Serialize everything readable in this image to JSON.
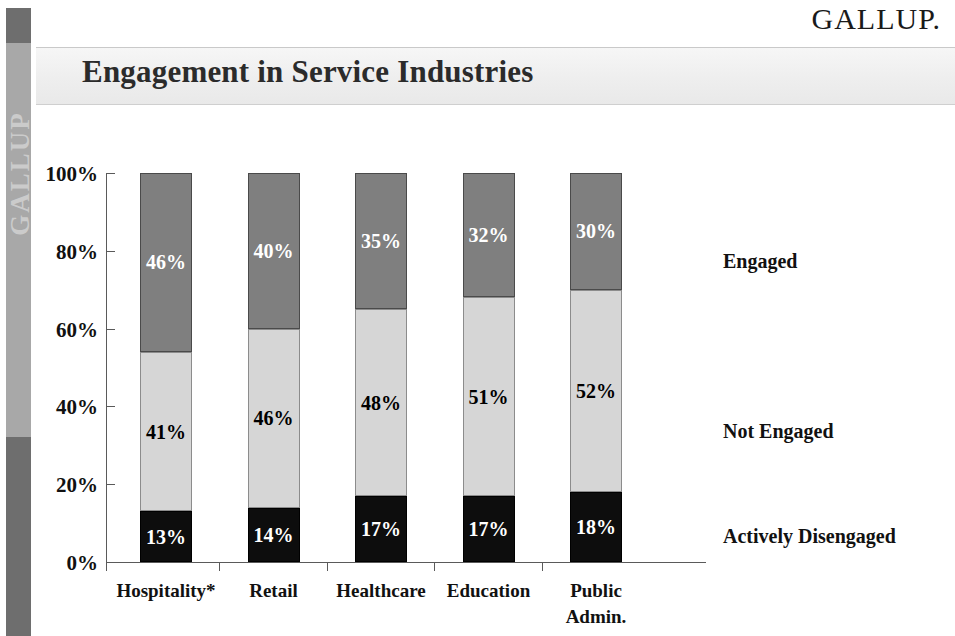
{
  "brand": {
    "logo_text": "GALLUP.",
    "watermark_text": "GALLUP"
  },
  "header": {
    "title": "Engagement in Service Industries"
  },
  "chart_data": {
    "type": "bar",
    "subtype": "stacked-100-percent",
    "title": "Engagement in Service Industries",
    "xlabel": "",
    "ylabel": "",
    "ylim": [
      0,
      100
    ],
    "ytick_labels": [
      "100%",
      "80%",
      "60%",
      "40%",
      "20%",
      "0%"
    ],
    "ytick_values": [
      100,
      80,
      60,
      40,
      20,
      0
    ],
    "grid": false,
    "legend_position": "right",
    "categories": [
      "Hospitality*",
      "Retail",
      "Healthcare",
      "Education",
      "Public Admin."
    ],
    "category_lines": [
      [
        "Hospitality*"
      ],
      [
        "Retail"
      ],
      [
        "Healthcare"
      ],
      [
        "Education"
      ],
      [
        "Public",
        "Admin."
      ]
    ],
    "series": [
      {
        "name": "Engaged",
        "color": "#7f7f7f",
        "values": [
          46,
          40,
          35,
          32,
          30
        ],
        "labels": [
          "46%",
          "40%",
          "35%",
          "32%",
          "30%"
        ]
      },
      {
        "name": "Not Engaged",
        "color": "#d6d6d6",
        "values": [
          41,
          46,
          48,
          51,
          52
        ],
        "labels": [
          "41%",
          "46%",
          "48%",
          "51%",
          "52%"
        ]
      },
      {
        "name": "Actively Disengaged",
        "color": "#0d0d0d",
        "values": [
          13,
          14,
          17,
          17,
          18
        ],
        "labels": [
          "13%",
          "14%",
          "17%",
          "17%",
          "18%"
        ]
      }
    ],
    "legend": [
      "Engaged",
      "Not Engaged",
      "Actively Disengaged"
    ]
  }
}
